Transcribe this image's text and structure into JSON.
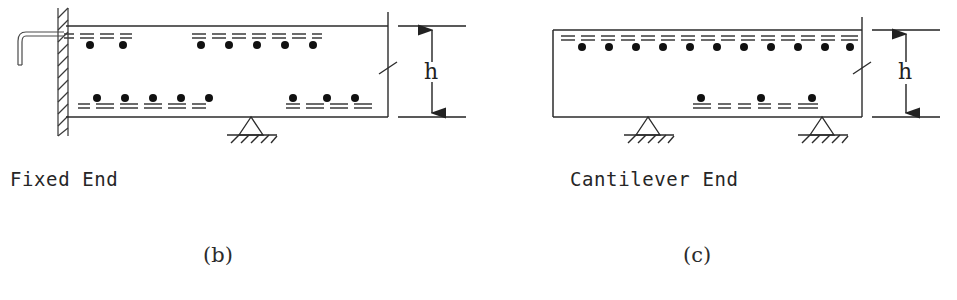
{
  "figure": {
    "background_color": "#ffffff",
    "line_color": "#2b2b2b",
    "rebar_color": "#3a3a3a",
    "dot_color": "#111111",
    "panels": [
      {
        "id": "b",
        "sublabel": "(b)",
        "caption": "Fixed End",
        "support_type": "fixed-wall-with-pin",
        "dimension_label": "h",
        "left_end": "wall-hatched",
        "right_end": "break-line",
        "anchor_hook": "L-shaped-hook-bar",
        "top_rebar_dot_counts": [
          2,
          5
        ],
        "bottom_rebar_dot_counts": [
          5,
          3
        ],
        "support_count": 1
      },
      {
        "id": "c",
        "sublabel": "(c)",
        "caption": "Cantilever End",
        "support_type": "two-pin-supports",
        "dimension_label": "h",
        "left_end": "closed-rectangle",
        "right_end": "break-line",
        "anchor_hook": "none",
        "top_rebar_dot_counts": [
          11
        ],
        "bottom_rebar_dot_counts": [
          3
        ],
        "support_count": 2
      }
    ],
    "captions": {
      "fixed_end": "Fixed End",
      "cantilever_end": "Cantilever End"
    },
    "sublabels": {
      "panel_b": "(b)",
      "panel_c": "(c)"
    },
    "dimensions": {
      "height_symbol_b": "h",
      "height_symbol_c": "h"
    }
  }
}
